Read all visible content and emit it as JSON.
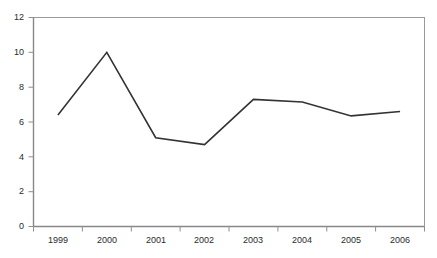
{
  "chart_data": {
    "type": "line",
    "title": "",
    "subtitle": "",
    "xlabel": "",
    "ylabel": "",
    "categories": [
      "1999",
      "2000",
      "2001",
      "2002",
      "2003",
      "2004",
      "2005",
      "2006"
    ],
    "series": [
      {
        "name": "",
        "values": [
          6.4,
          10.0,
          5.1,
          4.7,
          7.3,
          7.15,
          6.35,
          6.6
        ],
        "color": "#333333",
        "line_width": 1.6,
        "markers": false
      }
    ],
    "ylim": [
      0,
      12
    ],
    "y_ticks": [
      0,
      2,
      4,
      6,
      8,
      10,
      12
    ],
    "y_tick_labels": [
      "0",
      "2",
      "4",
      "6",
      "8",
      "10",
      "12"
    ],
    "x_tick_labels": [
      "1999",
      "2000",
      "2001",
      "2002",
      "2003",
      "2004",
      "2005",
      "2006"
    ],
    "grid": false,
    "legend": false,
    "legend_position": "none",
    "annotations": [],
    "axis_color": "#999999",
    "plot_border": true,
    "background_color": "#ffffff",
    "tick_text_color": "#2b2b2b"
  }
}
